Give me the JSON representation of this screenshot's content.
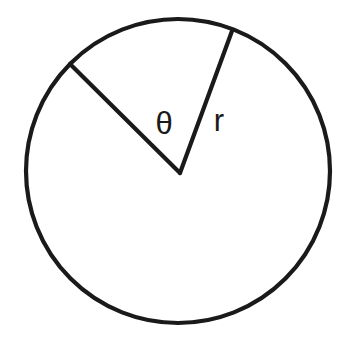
{
  "figure": {
    "background_color": "#ffffff",
    "stroke_color": "#1a1a1a",
    "stroke_width": 4.2,
    "width": 354,
    "height": 341
  },
  "circle": {
    "name": "circle-outline",
    "center_x": 178,
    "center_y": 171,
    "radius": 152
  },
  "radii": [
    {
      "name": "radius-left",
      "label": "",
      "from_x": 180,
      "from_y": 173,
      "to_x": 70,
      "to_y": 64,
      "angle_degrees": 135.3
    },
    {
      "name": "radius-right",
      "label": "r",
      "from_x": 180,
      "from_y": 173,
      "to_x": 232,
      "to_y": 31,
      "angle_degrees": 69.9
    }
  ],
  "labels": {
    "theta": {
      "text": "θ",
      "x": 164,
      "y": 126,
      "font_size": 31
    },
    "radius": {
      "text": "r",
      "x": 219,
      "y": 123,
      "font_size": 31
    }
  },
  "angle": {
    "symbol": "θ",
    "measure_degrees": 65.4,
    "vertex_x": 180,
    "vertex_y": 173
  }
}
